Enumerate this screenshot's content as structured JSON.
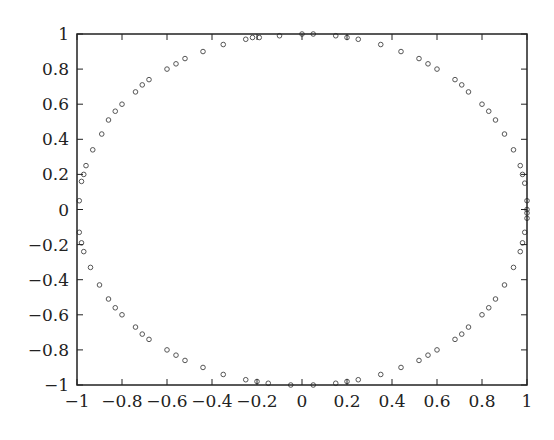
{
  "chart_data": {
    "type": "scatter",
    "title": "",
    "xlabel": "",
    "ylabel": "",
    "xlim": [
      -1,
      1
    ],
    "ylim": [
      -1,
      1
    ],
    "grid": false,
    "legend": null,
    "marker": "open-circle",
    "x_ticks": [
      "-1",
      "-0.8",
      "-0.6",
      "-0.4",
      "-0.2",
      "0",
      "0.2",
      "0.4",
      "0.6",
      "0.8",
      "1"
    ],
    "y_ticks": [
      "1",
      "0.8",
      "0.6",
      "0.4",
      "0.2",
      "0",
      "-0.2",
      "-0.4",
      "-0.6",
      "-0.8",
      "-1"
    ],
    "x_tick_values": [
      -1,
      -0.8,
      -0.6,
      -0.4,
      -0.2,
      0,
      0.2,
      0.4,
      0.6,
      0.8,
      1
    ],
    "y_tick_values": [
      1,
      0.8,
      0.6,
      0.4,
      0.2,
      0,
      -0.2,
      -0.4,
      -0.6,
      -0.8,
      -1
    ],
    "series": [
      {
        "name": "points",
        "x": [
          -0.99,
          -0.98,
          -0.97,
          -0.96,
          -0.93,
          -0.89,
          -0.86,
          -0.83,
          -0.8,
          -0.74,
          -0.71,
          -0.68,
          -0.6,
          -0.56,
          -0.52,
          -0.44,
          -0.35,
          -0.25,
          -0.22,
          -0.19,
          -0.1,
          0.0,
          0.05,
          0.15,
          0.2,
          0.25,
          0.35,
          0.44,
          0.52,
          0.56,
          0.6,
          0.68,
          0.71,
          0.74,
          0.8,
          0.83,
          0.86,
          0.9,
          0.94,
          0.97,
          0.98,
          0.99,
          1.0,
          1.0,
          1.0,
          -0.99,
          -0.98,
          -0.97,
          -0.94,
          -0.9,
          -0.86,
          -0.83,
          -0.8,
          -0.74,
          -0.71,
          -0.68,
          -0.6,
          -0.56,
          -0.52,
          -0.44,
          -0.35,
          -0.25,
          -0.2,
          -0.15,
          -0.05,
          0.05,
          0.15,
          0.2,
          0.25,
          0.35,
          0.44,
          0.52,
          0.56,
          0.6,
          0.68,
          0.71,
          0.74,
          0.8,
          0.83,
          0.86,
          0.9,
          0.94,
          0.97,
          0.98,
          0.99,
          1.0
        ],
        "y": [
          0.05,
          0.16,
          0.2,
          0.25,
          0.34,
          0.43,
          0.51,
          0.56,
          0.6,
          0.67,
          0.71,
          0.74,
          0.8,
          0.83,
          0.86,
          0.9,
          0.94,
          0.97,
          0.98,
          0.98,
          0.99,
          1.0,
          1.0,
          0.99,
          0.98,
          0.97,
          0.94,
          0.9,
          0.86,
          0.83,
          0.8,
          0.74,
          0.71,
          0.67,
          0.6,
          0.56,
          0.51,
          0.43,
          0.34,
          0.25,
          0.2,
          0.15,
          0.05,
          -0.02,
          0.0,
          -0.13,
          -0.19,
          -0.24,
          -0.33,
          -0.43,
          -0.51,
          -0.56,
          -0.6,
          -0.67,
          -0.71,
          -0.74,
          -0.8,
          -0.83,
          -0.86,
          -0.9,
          -0.94,
          -0.97,
          -0.98,
          -0.99,
          -1.0,
          -1.0,
          -0.99,
          -0.98,
          -0.97,
          -0.94,
          -0.9,
          -0.86,
          -0.83,
          -0.8,
          -0.74,
          -0.71,
          -0.67,
          -0.6,
          -0.56,
          -0.51,
          -0.43,
          -0.33,
          -0.24,
          -0.19,
          -0.13,
          -0.05
        ]
      }
    ]
  }
}
